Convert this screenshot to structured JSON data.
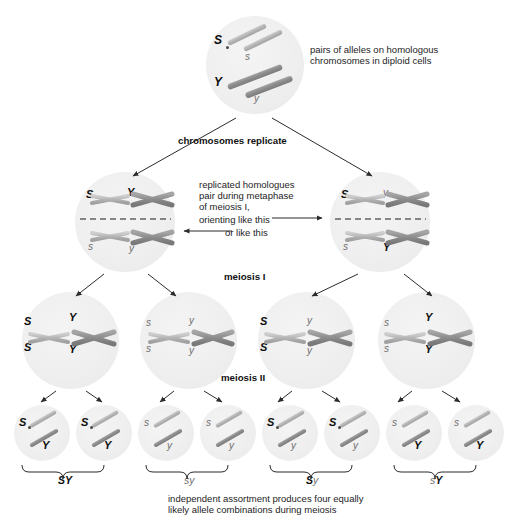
{
  "diagram": {
    "annotations": {
      "top_note": "pairs of alleles on homologous\nchromosomes in diploid cells",
      "replicate_label": "chromosomes replicate",
      "metaphase_note_line1": "replicated homologues",
      "metaphase_note_line2": "pair during metaphase",
      "metaphase_note_line3": "of meiosis I,",
      "metaphase_note_line4": "orienting like this",
      "metaphase_note_line5": "or like this",
      "meiosis_one_label": "meiosis I",
      "meiosis_two_label": "meiosis II",
      "caption": "independent assortment produces four equally\nlikely allele combinations during meiosis"
    },
    "colors": {
      "cell_fill": "#efefef",
      "chromosome_light": "#b4b4b4",
      "chromosome_dark": "#8b8b8b",
      "dominant_text": "#0d0d0d",
      "recessive_text": "#6f6f6f",
      "line": "#2b2b2b"
    },
    "parent_cell": {
      "name": "diploid-parent-cell",
      "alleles": [
        {
          "symbol": "S",
          "type": "dominant"
        },
        {
          "symbol": "s",
          "type": "recessive"
        },
        {
          "symbol": "Y",
          "type": "dominant"
        },
        {
          "symbol": "y",
          "type": "recessive"
        }
      ]
    },
    "metaphase_cells": [
      {
        "name": "metaphase-cell-left",
        "above_line": [
          {
            "symbol": "S",
            "type": "dominant"
          },
          {
            "symbol": "Y",
            "type": "dominant"
          }
        ],
        "below_line": [
          {
            "symbol": "s",
            "type": "recessive"
          },
          {
            "symbol": "y",
            "type": "recessive"
          }
        ]
      },
      {
        "name": "metaphase-cell-right",
        "above_line": [
          {
            "symbol": "S",
            "type": "dominant"
          },
          {
            "symbol": "y",
            "type": "recessive"
          }
        ],
        "below_line": [
          {
            "symbol": "s",
            "type": "recessive"
          },
          {
            "symbol": "Y",
            "type": "dominant"
          }
        ]
      }
    ],
    "meiosis_one_products": [
      {
        "name": "meiosis-i-cell-1",
        "top_left": "S",
        "bottom_left": "S",
        "top_right": "Y",
        "bottom_right": "Y",
        "tl_type": "dominant",
        "bl_type": "dominant",
        "tr_type": "dominant",
        "br_type": "dominant"
      },
      {
        "name": "meiosis-i-cell-2",
        "top_left": "s",
        "bottom_left": "s",
        "top_right": "y",
        "bottom_right": "y",
        "tl_type": "recessive",
        "bl_type": "recessive",
        "tr_type": "recessive",
        "br_type": "recessive"
      },
      {
        "name": "meiosis-i-cell-3",
        "top_left": "S",
        "bottom_left": "S",
        "top_right": "y",
        "bottom_right": "y",
        "tl_type": "dominant",
        "bl_type": "dominant",
        "tr_type": "recessive",
        "br_type": "recessive"
      },
      {
        "name": "meiosis-i-cell-4",
        "top_left": "s",
        "bottom_left": "s",
        "top_right": "Y",
        "bottom_right": "Y",
        "tl_type": "recessive",
        "bl_type": "recessive",
        "tr_type": "dominant",
        "br_type": "dominant"
      }
    ],
    "gametes": [
      {
        "name": "gamete-1",
        "upper": "S",
        "lower": "Y",
        "upper_type": "dominant",
        "lower_type": "dominant"
      },
      {
        "name": "gamete-2",
        "upper": "S",
        "lower": "Y",
        "upper_type": "dominant",
        "lower_type": "dominant"
      },
      {
        "name": "gamete-3",
        "upper": "s",
        "lower": "y",
        "upper_type": "recessive",
        "lower_type": "recessive"
      },
      {
        "name": "gamete-4",
        "upper": "s",
        "lower": "y",
        "upper_type": "recessive",
        "lower_type": "recessive"
      },
      {
        "name": "gamete-5",
        "upper": "S",
        "lower": "y",
        "upper_type": "dominant",
        "lower_type": "recessive"
      },
      {
        "name": "gamete-6",
        "upper": "S",
        "lower": "y",
        "upper_type": "dominant",
        "lower_type": "recessive"
      },
      {
        "name": "gamete-7",
        "upper": "s",
        "lower": "Y",
        "upper_type": "recessive",
        "lower_type": "dominant"
      },
      {
        "name": "gamete-8",
        "upper": "s",
        "lower": "Y",
        "upper_type": "recessive",
        "lower_type": "dominant"
      }
    ],
    "genotypes": [
      {
        "name": "genotype-sy-1",
        "first": "S",
        "second": "Y",
        "first_type": "dominant",
        "second_type": "dominant"
      },
      {
        "name": "genotype-sy-2",
        "first": "s",
        "second": "y",
        "first_type": "recessive",
        "second_type": "recessive"
      },
      {
        "name": "genotype-sy-3",
        "first": "S",
        "second": "y",
        "first_type": "dominant",
        "second_type": "recessive"
      },
      {
        "name": "genotype-sy-4",
        "first": "s",
        "second": "Y",
        "first_type": "recessive",
        "second_type": "dominant"
      }
    ]
  }
}
